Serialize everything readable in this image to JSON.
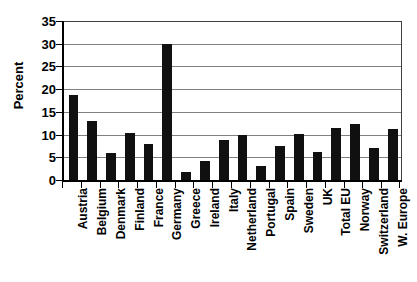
{
  "chart_data": {
    "type": "bar",
    "title": "",
    "xlabel": "",
    "ylabel": "Percent",
    "ylim": [
      0,
      35
    ],
    "ytick_step": 5,
    "yticks": [
      35,
      30,
      25,
      20,
      15,
      10,
      5,
      0
    ],
    "grid": true,
    "legend": "none",
    "bar_color": "#101010",
    "gridline_color": "#808080",
    "axis_color": "#000000",
    "categories": [
      "Austria",
      "Belgium",
      "Denmark",
      "Finland",
      "France",
      "Germany",
      "Greece",
      "Ireland",
      "Italy",
      "Netherland",
      "Portugal",
      "Spain",
      "Sweden",
      "UK",
      "Total EU",
      "Norway",
      "Switzerland",
      "W. Europe"
    ],
    "values": [
      18.8,
      12.9,
      6.0,
      10.3,
      8.0,
      30.0,
      1.8,
      4.2,
      8.7,
      10.0,
      3.1,
      7.5,
      10.2,
      6.2,
      11.4,
      12.4,
      7.0,
      11.3
    ]
  }
}
